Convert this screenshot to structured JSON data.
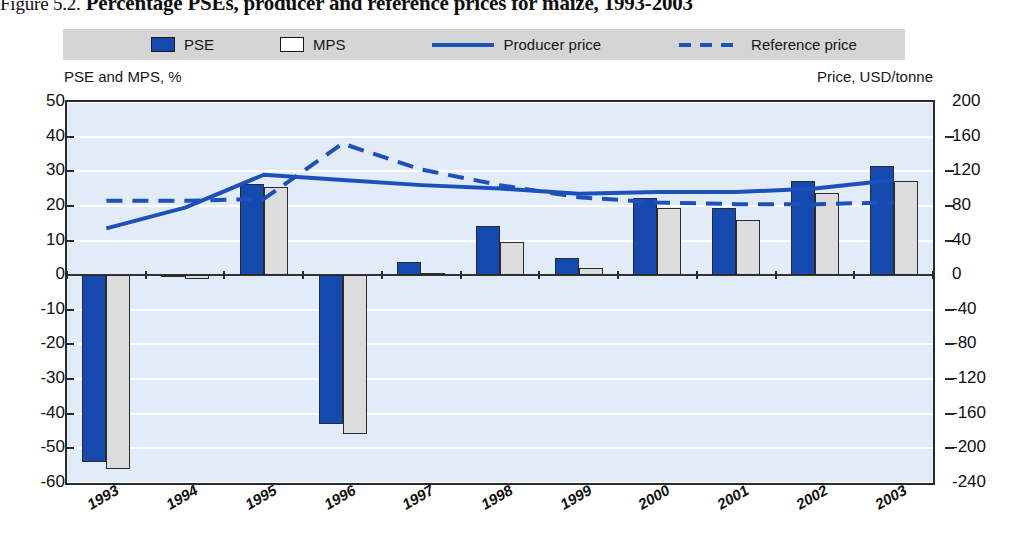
{
  "figure": {
    "number": "Figure 5.2.",
    "title": "Percentage PSEs, producer and reference prices for maize, 1993-2003"
  },
  "legend": {
    "items": [
      {
        "label": "PSE",
        "marker": "filled-square-swatch",
        "color": "#1449b0"
      },
      {
        "label": "MPS",
        "marker": "hollow-square-swatch",
        "color": "#ffffff"
      },
      {
        "label": "Producer price",
        "marker": "solid-line-swatch",
        "color": "#1b51b8"
      },
      {
        "label": "Reference price",
        "marker": "dashed-line-swatch",
        "color": "#1b51b8"
      }
    ],
    "background": "#d5d5d5"
  },
  "axis_captions": {
    "left": "PSE and MPS, %",
    "right": "Price, USD/tonne"
  },
  "chart_data": {
    "type": "bar",
    "title": "Percentage PSEs, producer and reference prices for maize, 1993-2003",
    "xlabel": "",
    "ylabel": "PSE and MPS, %",
    "y2label": "Price, USD/tonne",
    "categories": [
      "1993",
      "1994",
      "1995",
      "1996",
      "1997",
      "1998",
      "1999",
      "2000",
      "2001",
      "2002",
      "2003"
    ],
    "ylim": [
      -60,
      50
    ],
    "yticks": [
      50,
      40,
      30,
      20,
      10,
      0,
      -10,
      -20,
      -30,
      -40,
      -50,
      -60
    ],
    "y2lim": [
      -240,
      200
    ],
    "y2ticks": [
      200,
      160,
      120,
      80,
      40,
      0,
      -40,
      -80,
      -120,
      -160,
      -200,
      -240
    ],
    "grid": true,
    "legend_position": "top",
    "series": [
      {
        "name": "PSE",
        "type": "bar",
        "axis": "left",
        "unit": "%",
        "color": "#1449b0",
        "values": [
          -54.0,
          -0.3,
          26.3,
          -43.0,
          3.9,
          14.1,
          5.1,
          22.3,
          19.5,
          27.2,
          31.5
        ]
      },
      {
        "name": "MPS",
        "type": "bar",
        "axis": "left",
        "unit": "%",
        "color": "#dcdcdc",
        "values": [
          -56.0,
          -1.2,
          25.5,
          -46.0,
          0.6,
          9.5,
          2.2,
          19.4,
          16.0,
          23.8,
          27.2
        ]
      },
      {
        "name": "Producer price",
        "type": "line",
        "axis": "right",
        "unit": "USD/tonne",
        "color": "#1b51b8",
        "style": "solid",
        "values": [
          54,
          78,
          116,
          110,
          104,
          100,
          94,
          96,
          96,
          100,
          110
        ]
      },
      {
        "name": "Reference price",
        "type": "line",
        "axis": "right",
        "unit": "USD/tonne",
        "color": "#1b51b8",
        "style": "dashed",
        "values": [
          86,
          86,
          88,
          152,
          122,
          104,
          90,
          84,
          82,
          82,
          84
        ]
      }
    ]
  }
}
